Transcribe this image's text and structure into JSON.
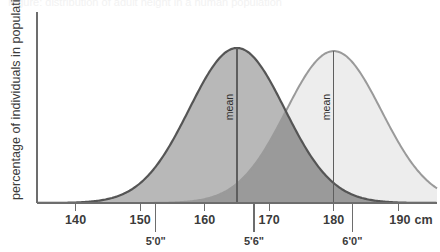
{
  "figure": {
    "clipped_title": "Figure: distribution of adult height in a human population",
    "ylabel": "percentage of individuals in population",
    "unit_label": "cm"
  },
  "axis": {
    "cm_ticks": [
      "140",
      "150",
      "160",
      "170",
      "180",
      "190"
    ],
    "cm_unit_suffix": "cm",
    "imperial_ticks": [
      "5'0\"",
      "5'6\"",
      "6'0\""
    ]
  },
  "annotations": {
    "mean_left": "mean",
    "mean_right": "mean"
  },
  "colors": {
    "curve_left_fill": "#b8b8b8",
    "curve_left_stroke": "#555555",
    "curve_right_fill": "#ededed",
    "curve_right_stroke": "#9a9a9a",
    "overlap_fill": "#9a9a9a",
    "axis": "#6d6d6d",
    "text": "#3b3b3b",
    "background": "#ffffff"
  },
  "chart_data": {
    "type": "area",
    "title": "",
    "xlabel": "height (cm)",
    "ylabel": "percentage of individuals in population",
    "xlim": [
      134,
      196
    ],
    "ylim": [
      0,
      1
    ],
    "grid": false,
    "legend": "none",
    "xticks": [
      140,
      150,
      160,
      170,
      180,
      190
    ],
    "xtick_labels": [
      "140",
      "150",
      "160",
      "170",
      "180",
      "190 cm"
    ],
    "secondary_xticks": [
      152.4,
      167.64,
      182.88
    ],
    "secondary_xtick_labels": [
      "5'0\"",
      "5'6\"",
      "6'0\""
    ],
    "series": [
      {
        "name": "female height distribution",
        "distribution": "normal",
        "mean": 165,
        "sd": 7.4,
        "peak_height": 1.0,
        "fill": "#b8b8b8",
        "stroke": "#555555",
        "annotation": "mean"
      },
      {
        "name": "male height distribution",
        "distribution": "normal",
        "mean": 180,
        "sd": 7.4,
        "peak_height": 0.98,
        "fill": "#ededed",
        "stroke": "#9a9a9a",
        "annotation": "mean"
      }
    ],
    "overlap_region_fill": "#9a9a9a"
  }
}
